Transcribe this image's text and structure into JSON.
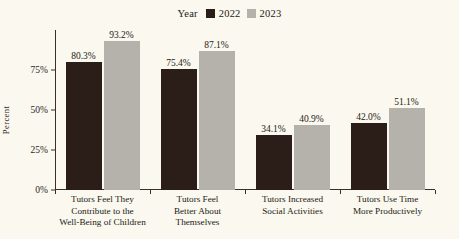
{
  "chart_data": {
    "type": "bar",
    "title": "",
    "subtitle": "",
    "xlabel": "",
    "ylabel": "Percent",
    "ylim": [
      0,
      100
    ],
    "yticks": [
      "0%",
      "25%",
      "50%",
      "75%"
    ],
    "ytick_values": [
      0,
      25,
      50,
      75
    ],
    "grid": false,
    "legend_position": "top-center",
    "legend_title": "Year",
    "categories": [
      "Tutors Feel They Contribute to the Well-Being of Children",
      "Tutors Feel Better About Themselves",
      "Tutors Increased Social Activities",
      "Tutors Use Time More Productively"
    ],
    "category_lines": [
      [
        "Tutors Feel They",
        "Contribute to the",
        "Well-Being of Children"
      ],
      [
        "Tutors Feel",
        "Better About",
        "Themselves"
      ],
      [
        "Tutors Increased",
        "Social Activities"
      ],
      [
        "Tutors Use Time",
        "More Productively"
      ]
    ],
    "series": [
      {
        "name": "2022",
        "color": "#2b1d18",
        "values": [
          80.3,
          75.4,
          34.1,
          42.0
        ],
        "labels": [
          "80.3%",
          "75.4%",
          "34.1%",
          "42.0%"
        ]
      },
      {
        "name": "2023",
        "color": "#b5b2ab",
        "values": [
          93.2,
          87.1,
          40.9,
          51.1
        ],
        "labels": [
          "93.2%",
          "87.1%",
          "40.9%",
          "51.1%"
        ]
      }
    ]
  },
  "colors": {
    "background": "#faf8ef",
    "axis": "#3a2e26",
    "text": "#231a14",
    "series_2022": "#2b1d18",
    "series_2023": "#b5b2ab"
  }
}
